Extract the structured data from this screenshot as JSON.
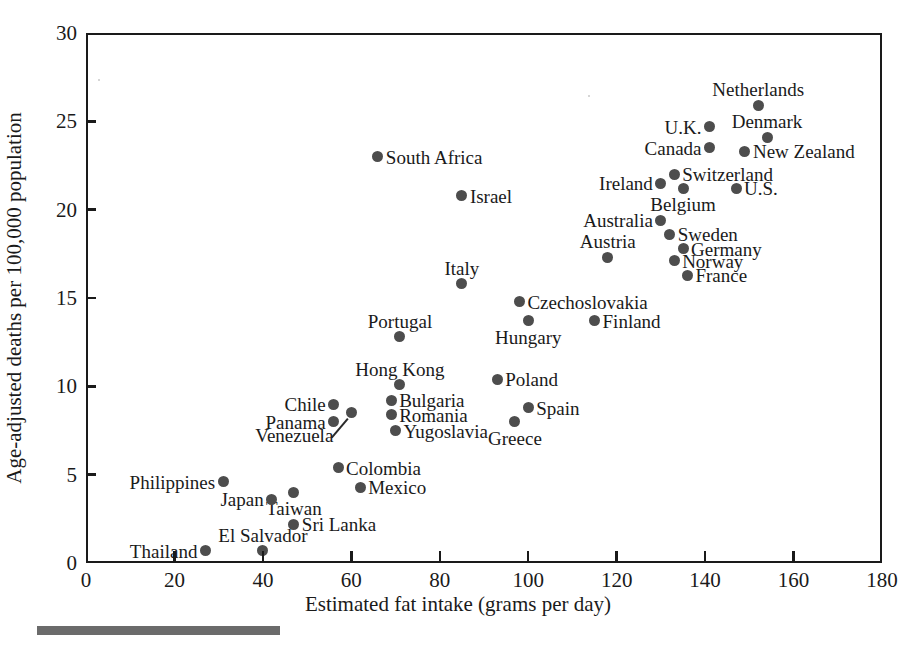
{
  "chart_data": {
    "type": "scatter",
    "title": "",
    "xlabel": "Estimated fat intake (grams per day)",
    "ylabel": "Age-adjusted deaths per 100,000 population",
    "xlim": [
      0,
      180
    ],
    "ylim": [
      0,
      30
    ],
    "xticks": [
      0,
      20,
      40,
      60,
      80,
      100,
      120,
      140,
      160,
      180
    ],
    "yticks": [
      0,
      5,
      10,
      15,
      20,
      25,
      30
    ],
    "grid": false,
    "legend": null,
    "point_color": "#4d4d4d",
    "axis_color": "#1a1a1a",
    "points": [
      {
        "label": "Netherlands",
        "x": 152,
        "y": 25.9,
        "label_pos": "above"
      },
      {
        "label": "U.K.",
        "x": 141,
        "y": 24.7,
        "label_pos": "left"
      },
      {
        "label": "Denmark",
        "x": 154,
        "y": 24.1,
        "label_pos": "above"
      },
      {
        "label": "Canada",
        "x": 141,
        "y": 23.5,
        "label_pos": "left"
      },
      {
        "label": "New Zealand",
        "x": 149,
        "y": 23.3,
        "label_pos": "right"
      },
      {
        "label": "South Africa",
        "x": 66,
        "y": 23.0,
        "label_pos": "right"
      },
      {
        "label": "Switzerland",
        "x": 133,
        "y": 22.0,
        "label_pos": "right"
      },
      {
        "label": "Ireland",
        "x": 130,
        "y": 21.5,
        "label_pos": "left"
      },
      {
        "label": "Belgium",
        "x": 135,
        "y": 21.2,
        "label_pos": "below"
      },
      {
        "label": "U.S.",
        "x": 147,
        "y": 21.2,
        "label_pos": "right"
      },
      {
        "label": "Israel",
        "x": 85,
        "y": 20.8,
        "label_pos": "right"
      },
      {
        "label": "Australia",
        "x": 130,
        "y": 19.4,
        "label_pos": "left"
      },
      {
        "label": "Sweden",
        "x": 132,
        "y": 18.6,
        "label_pos": "right"
      },
      {
        "label": "Germany",
        "x": 135,
        "y": 17.8,
        "label_pos": "right"
      },
      {
        "label": "Austria",
        "x": 118,
        "y": 17.3,
        "label_pos": "above"
      },
      {
        "label": "Norway",
        "x": 133,
        "y": 17.1,
        "label_pos": "right"
      },
      {
        "label": "France",
        "x": 136,
        "y": 16.3,
        "label_pos": "right"
      },
      {
        "label": "Italy",
        "x": 85,
        "y": 15.8,
        "label_pos": "above"
      },
      {
        "label": "Czechoslovakia",
        "x": 98,
        "y": 14.8,
        "label_pos": "right"
      },
      {
        "label": "Hungary",
        "x": 100,
        "y": 13.7,
        "label_pos": "below"
      },
      {
        "label": "Finland",
        "x": 115,
        "y": 13.7,
        "label_pos": "right"
      },
      {
        "label": "Portugal",
        "x": 71,
        "y": 12.8,
        "label_pos": "above"
      },
      {
        "label": "Poland",
        "x": 93,
        "y": 10.4,
        "label_pos": "right"
      },
      {
        "label": "Hong Kong",
        "x": 71,
        "y": 10.1,
        "label_pos": "above"
      },
      {
        "label": "Bulgaria",
        "x": 69,
        "y": 9.2,
        "label_pos": "right"
      },
      {
        "label": "Chile",
        "x": 56,
        "y": 9.0,
        "label_pos": "left"
      },
      {
        "label": "Spain",
        "x": 100,
        "y": 8.8,
        "label_pos": "right"
      },
      {
        "label": "Venezuela",
        "x": 60,
        "y": 8.5,
        "label_pos": "leader"
      },
      {
        "label": "Romania",
        "x": 69,
        "y": 8.4,
        "label_pos": "right"
      },
      {
        "label": "Panama",
        "x": 56,
        "y": 8.0,
        "label_pos": "left"
      },
      {
        "label": "Greece",
        "x": 97,
        "y": 8.0,
        "label_pos": "below"
      },
      {
        "label": "Yugoslavia",
        "x": 70,
        "y": 7.5,
        "label_pos": "right"
      },
      {
        "label": "Colombia",
        "x": 57,
        "y": 5.4,
        "label_pos": "right"
      },
      {
        "label": "Philippines",
        "x": 31,
        "y": 4.6,
        "label_pos": "left"
      },
      {
        "label": "Mexico",
        "x": 62,
        "y": 4.3,
        "label_pos": "right"
      },
      {
        "label": "Taiwan",
        "x": 47,
        "y": 4.0,
        "label_pos": "below"
      },
      {
        "label": "Japan",
        "x": 42,
        "y": 3.6,
        "label_pos": "left"
      },
      {
        "label": "Sri Lanka",
        "x": 47,
        "y": 2.2,
        "label_pos": "right"
      },
      {
        "label": "Thailand",
        "x": 27,
        "y": 0.7,
        "label_pos": "left"
      },
      {
        "label": "El Salvador",
        "x": 40,
        "y": 0.7,
        "label_pos": "above"
      }
    ]
  }
}
